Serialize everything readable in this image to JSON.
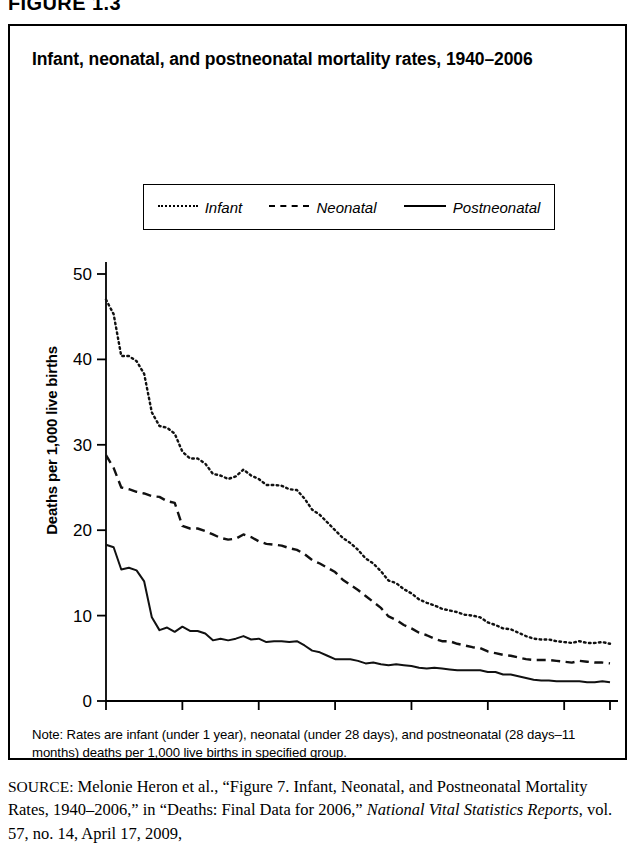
{
  "figure_number": "FIGURE 1.3",
  "title": "Infant, neonatal, and postneonatal mortality rates, 1940–2006",
  "legend": {
    "items": [
      {
        "label": "Infant",
        "style": "dotted"
      },
      {
        "label": "Neonatal",
        "style": "dashed"
      },
      {
        "label": "Postneonatal",
        "style": "solid"
      }
    ]
  },
  "note": "Note: Rates are infant (under 1 year), neonatal (under 28 days), and postneonatal (28 days–11 months) deaths per 1,000 live births in specified group.",
  "source": {
    "label": "SOURCE:",
    "text_1": " Melonie Heron et al., “Figure 7. Infant, Neonatal, and Postneonatal Mortality Rates, 1940–2006,” in “Deaths: Final Data for 2006,” ",
    "italic": "National Vital Statistics Reports",
    "text_2": ", vol. 57, no. 14, April 17, 2009,"
  },
  "chart_data": {
    "type": "line",
    "title": "Infant, neonatal, and postneonatal mortality rates, 1940–2006",
    "xlabel": "",
    "ylabel": "Deaths per 1,000 live births",
    "xlim": [
      1940,
      2006
    ],
    "ylim": [
      0,
      50
    ],
    "xticks": [
      1940,
      1950,
      1960,
      1970,
      1980,
      1990,
      2000,
      2006
    ],
    "yticks": [
      0,
      10,
      20,
      30,
      40,
      50
    ],
    "grid": false,
    "legend_position": "top",
    "x": [
      1940,
      1941,
      1942,
      1943,
      1944,
      1945,
      1946,
      1947,
      1948,
      1949,
      1950,
      1951,
      1952,
      1953,
      1954,
      1955,
      1956,
      1957,
      1958,
      1959,
      1960,
      1961,
      1962,
      1963,
      1964,
      1965,
      1966,
      1967,
      1968,
      1969,
      1970,
      1971,
      1972,
      1973,
      1974,
      1975,
      1976,
      1977,
      1978,
      1979,
      1980,
      1981,
      1982,
      1983,
      1984,
      1985,
      1986,
      1987,
      1988,
      1989,
      1990,
      1991,
      1992,
      1993,
      1994,
      1995,
      1996,
      1997,
      1998,
      1999,
      2000,
      2001,
      2002,
      2003,
      2004,
      2005,
      2006
    ],
    "series": [
      {
        "name": "Infant",
        "style": "dotted",
        "values": [
          47.0,
          45.3,
          40.4,
          40.4,
          39.8,
          38.3,
          33.8,
          32.2,
          32.0,
          31.3,
          29.2,
          28.4,
          28.4,
          27.8,
          26.6,
          26.4,
          26.0,
          26.3,
          27.1,
          26.4,
          26.0,
          25.3,
          25.3,
          25.2,
          24.8,
          24.7,
          23.7,
          22.4,
          21.8,
          20.9,
          20.0,
          19.1,
          18.5,
          17.7,
          16.7,
          16.1,
          15.2,
          14.1,
          13.8,
          13.1,
          12.6,
          11.9,
          11.5,
          11.2,
          10.8,
          10.6,
          10.4,
          10.1,
          10.0,
          9.8,
          9.2,
          8.9,
          8.5,
          8.4,
          8.0,
          7.6,
          7.3,
          7.2,
          7.2,
          7.0,
          6.9,
          6.8,
          7.0,
          6.8,
          6.8,
          6.9,
          6.7
        ]
      },
      {
        "name": "Neonatal",
        "style": "dashed",
        "values": [
          28.8,
          27.3,
          25.0,
          24.8,
          24.5,
          24.3,
          24.0,
          23.9,
          23.4,
          23.2,
          20.5,
          20.2,
          20.2,
          19.9,
          19.5,
          19.1,
          18.9,
          19.0,
          19.5,
          19.2,
          18.7,
          18.4,
          18.3,
          18.2,
          17.9,
          17.7,
          17.2,
          16.5,
          16.1,
          15.6,
          15.1,
          14.2,
          13.6,
          13.0,
          12.3,
          11.6,
          10.9,
          9.9,
          9.5,
          8.9,
          8.5,
          8.0,
          7.7,
          7.3,
          7.0,
          7.0,
          6.7,
          6.5,
          6.3,
          6.2,
          5.8,
          5.6,
          5.4,
          5.3,
          5.1,
          4.9,
          4.8,
          4.8,
          4.8,
          4.7,
          4.6,
          4.5,
          4.7,
          4.6,
          4.5,
          4.5,
          4.4
        ]
      },
      {
        "name": "Postneonatal",
        "style": "solid",
        "values": [
          18.3,
          18.0,
          15.4,
          15.6,
          15.3,
          14.0,
          9.8,
          8.3,
          8.6,
          8.1,
          8.7,
          8.2,
          8.2,
          7.9,
          7.1,
          7.3,
          7.1,
          7.3,
          7.6,
          7.2,
          7.3,
          6.9,
          7.0,
          7.0,
          6.9,
          7.0,
          6.5,
          5.9,
          5.7,
          5.3,
          4.9,
          4.9,
          4.9,
          4.7,
          4.4,
          4.5,
          4.3,
          4.2,
          4.3,
          4.2,
          4.1,
          3.9,
          3.8,
          3.9,
          3.8,
          3.7,
          3.6,
          3.6,
          3.6,
          3.6,
          3.4,
          3.4,
          3.1,
          3.1,
          2.9,
          2.7,
          2.5,
          2.4,
          2.4,
          2.3,
          2.3,
          2.3,
          2.3,
          2.2,
          2.2,
          2.3,
          2.2
        ]
      }
    ]
  }
}
